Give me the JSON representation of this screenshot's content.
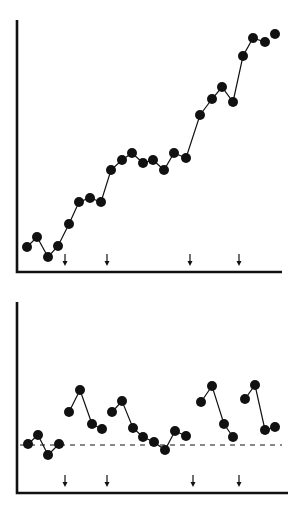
{
  "chart_data": [
    {
      "type": "line",
      "title": "",
      "xlabel": "",
      "ylabel": "",
      "grid": false,
      "legend": null,
      "description": "Cumulative record: steadily rising series with arrows marking intervention points",
      "x": [
        1,
        2,
        3,
        4,
        5,
        6,
        7,
        8,
        9,
        10,
        11,
        12,
        13,
        14,
        15,
        16,
        17,
        18,
        19,
        20,
        21,
        22,
        23,
        24
      ],
      "series": [
        {
          "name": "cumulative",
          "values": [
            1.0,
            1.4,
            0.6,
            1.1,
            2.0,
            2.9,
            3.0,
            2.9,
            4.2,
            4.6,
            4.9,
            4.5,
            4.6,
            4.2,
            4.9,
            4.7,
            6.4,
            7.1,
            7.5,
            6.9,
            8.8,
            9.5,
            9.3,
            9.7
          ],
          "connected_segments": [
            [
              1,
              23
            ],
            [
              24,
              24
            ]
          ]
        }
      ],
      "arrows_at_x": [
        4.5,
        8.5,
        16.5,
        20.5
      ],
      "ylim": [
        0,
        10.5
      ],
      "px": {
        "points": [
          [
            27,
            247
          ],
          [
            37,
            237
          ],
          [
            48,
            257
          ],
          [
            58,
            246
          ],
          [
            69,
            224
          ],
          [
            79,
            202
          ],
          [
            90,
            198
          ],
          [
            101,
            202
          ],
          [
            111,
            170
          ],
          [
            122,
            160
          ],
          [
            132,
            153
          ],
          [
            143,
            163
          ],
          [
            153,
            160
          ],
          [
            164,
            170
          ],
          [
            174,
            153
          ],
          [
            186,
            158
          ],
          [
            200,
            115
          ],
          [
            212,
            99
          ],
          [
            222,
            87
          ],
          [
            233,
            102
          ],
          [
            243,
            56
          ],
          [
            253,
            38
          ],
          [
            265,
            42
          ],
          [
            275,
            34
          ]
        ],
        "segments": [
          [
            0,
            22
          ],
          [
            23,
            23
          ]
        ],
        "arrows": [
          65,
          107,
          190,
          239
        ],
        "arrow_y": 260,
        "axis": {
          "x0": 17,
          "y0": 272,
          "ytop": 20,
          "xend": 282
        }
      }
    },
    {
      "type": "line",
      "title": "",
      "xlabel": "",
      "ylabel": "",
      "grid": false,
      "legend": null,
      "description": "Non-cumulative record: values jump after each arrow then decay toward dashed baseline",
      "x": [
        1,
        2,
        3,
        4,
        5,
        6,
        7,
        8,
        9,
        10,
        11,
        12,
        13,
        14,
        15,
        16,
        17,
        18,
        19,
        20,
        21,
        22,
        23,
        24
      ],
      "series": [
        {
          "name": "rate",
          "values": [
            1.0,
            1.2,
            0.8,
            1.0,
            1.7,
            2.2,
            1.4,
            1.3,
            1.7,
            1.9,
            1.3,
            1.1,
            1.0,
            0.9,
            1.3,
            1.2,
            1.9,
            2.3,
            1.4,
            1.1,
            2.0,
            2.3,
            1.3,
            1.4
          ],
          "connected_segments": [
            [
              1,
              4
            ],
            [
              5,
              8
            ],
            [
              9,
              16
            ],
            [
              17,
              20
            ],
            [
              21,
              24
            ]
          ]
        }
      ],
      "baseline": {
        "value": 1.0,
        "style": "dashed"
      },
      "arrows_at_x": [
        4.5,
        8.5,
        16.5,
        20.5
      ],
      "ylim": [
        0,
        3.5
      ],
      "px": {
        "points": [
          [
            28,
            444
          ],
          [
            38,
            435
          ],
          [
            48,
            455
          ],
          [
            59,
            444
          ],
          [
            69,
            412
          ],
          [
            80,
            390
          ],
          [
            92,
            424
          ],
          [
            102,
            429
          ],
          [
            112,
            412
          ],
          [
            122,
            401
          ],
          [
            133,
            428
          ],
          [
            143,
            437
          ],
          [
            154,
            442
          ],
          [
            165,
            450
          ],
          [
            175,
            431
          ],
          [
            186,
            436
          ],
          [
            201,
            402
          ],
          [
            212,
            386
          ],
          [
            224,
            424
          ],
          [
            233,
            437
          ],
          [
            245,
            399
          ],
          [
            255,
            385
          ],
          [
            265,
            430
          ],
          [
            275,
            427
          ]
        ],
        "segments": [
          [
            0,
            3
          ],
          [
            4,
            7
          ],
          [
            8,
            15
          ],
          [
            16,
            19
          ],
          [
            20,
            23
          ]
        ],
        "arrows": [
          65,
          107,
          193,
          239
        ],
        "arrow_y": 481,
        "baseline_y": 445,
        "baseline_x": [
          20,
          282
        ],
        "axis": {
          "x0": 17,
          "y0": 493,
          "ytop": 302,
          "xend": 288
        }
      }
    }
  ],
  "style": {
    "ink": "#111111",
    "background": "#ffffff",
    "marker_radius": 5
  }
}
